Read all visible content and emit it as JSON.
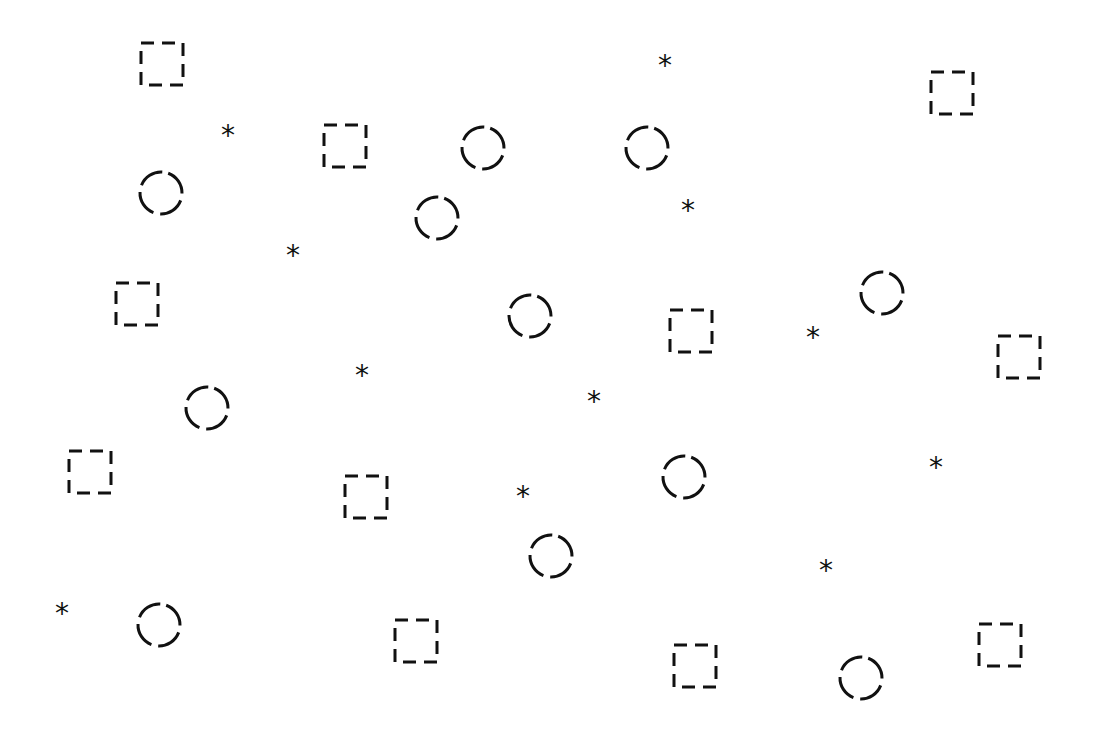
{
  "canvas": {
    "width": 1098,
    "height": 734,
    "background": "#ffffff",
    "stroke": "#111111"
  },
  "shapes": {
    "squares": [
      [
        162,
        64
      ],
      [
        345,
        146
      ],
      [
        137,
        304
      ],
      [
        691,
        331
      ],
      [
        1019,
        357
      ],
      [
        90,
        472
      ],
      [
        366,
        497
      ],
      [
        416,
        641
      ],
      [
        695,
        666
      ],
      [
        1000,
        645
      ],
      [
        952,
        93
      ]
    ],
    "circles": [
      [
        161,
        193
      ],
      [
        483,
        148
      ],
      [
        647,
        148
      ],
      [
        437,
        218
      ],
      [
        882,
        293
      ],
      [
        530,
        316
      ],
      [
        207,
        408
      ],
      [
        684,
        477
      ],
      [
        551,
        556
      ],
      [
        159,
        625
      ],
      [
        861,
        678
      ]
    ],
    "asterisks": [
      [
        228,
        131
      ],
      [
        665,
        61
      ],
      [
        293,
        251
      ],
      [
        688,
        206
      ],
      [
        813,
        333
      ],
      [
        362,
        371
      ],
      [
        594,
        397
      ],
      [
        936,
        463
      ],
      [
        523,
        492
      ],
      [
        826,
        566
      ],
      [
        62,
        609
      ]
    ],
    "asterisk_glyph": "*"
  }
}
